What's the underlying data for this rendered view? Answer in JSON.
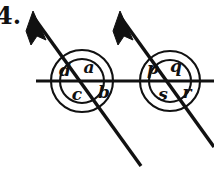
{
  "figure": {
    "problem_number": "4.",
    "background_color": "#ffffff",
    "ink_color": "#111111",
    "width": 214,
    "height": 176,
    "horizontal_line": {
      "name": "horizontal-line",
      "x1": 36,
      "y1": 81,
      "x2": 214,
      "y2": 81,
      "stroke_width": 3.2
    },
    "transversals": [
      {
        "name": "left-transversal",
        "x1": 35,
        "y1": 19,
        "x2": 141,
        "y2": 166,
        "stroke_width": 3.4,
        "arrow": {
          "name": "left-arrowhead",
          "direction": "up-left",
          "tip_x": 33,
          "tip_y": 11
        }
      },
      {
        "name": "right-transversal",
        "x1": 122,
        "y1": 19,
        "x2": 214,
        "y2": 147,
        "stroke_width": 3.4,
        "arrow": {
          "name": "right-arrowhead",
          "direction": "up-left",
          "tip_x": 120,
          "tip_y": 11
        }
      }
    ],
    "intersections": [
      {
        "name": "left-intersection",
        "center_x": 82,
        "center_y": 81,
        "circle_radius": 31,
        "labels": [
          {
            "id": "d",
            "text": "d",
            "x": 65,
            "y": 71,
            "position": "upper-left"
          },
          {
            "id": "a",
            "text": "a",
            "x": 89,
            "y": 68,
            "position": "upper-right"
          },
          {
            "id": "c",
            "text": "c",
            "x": 77,
            "y": 95,
            "position": "lower-left"
          },
          {
            "id": "b",
            "text": "b",
            "x": 104,
            "y": 93,
            "position": "lower-right"
          }
        ]
      },
      {
        "name": "right-intersection",
        "center_x": 170,
        "center_y": 81,
        "circle_radius": 30,
        "labels": [
          {
            "id": "p",
            "text": "p",
            "x": 153,
            "y": 69,
            "position": "upper-left"
          },
          {
            "id": "q",
            "text": "q",
            "x": 176,
            "y": 67,
            "position": "upper-right"
          },
          {
            "id": "s",
            "text": "s",
            "x": 163,
            "y": 95,
            "position": "lower-left"
          },
          {
            "id": "r",
            "text": "r",
            "x": 187,
            "y": 93,
            "position": "lower-right"
          }
        ]
      }
    ]
  }
}
